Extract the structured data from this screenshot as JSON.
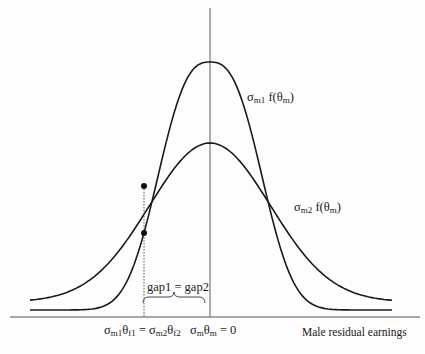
{
  "figure": {
    "curve_narrow_label": {
      "sigma": "σ",
      "sub": "m1",
      "func": " f(θ",
      "func_sub": "m",
      "close": ")"
    },
    "curve_wide_label": {
      "sigma": "σ",
      "sub": "m2",
      "func": " f(θ",
      "func_sub": "m",
      "close": ")"
    },
    "brace_label": "gap1 = gap2",
    "x_axis_label": "Male residual earnings",
    "x_tick_left": {
      "parts": [
        [
          "σ",
          "m1"
        ],
        [
          "θ",
          "f1"
        ],
        [
          " = σ",
          "m2"
        ],
        [
          "θ",
          "f2"
        ]
      ]
    },
    "x_tick_center": {
      "parts": [
        [
          "σ",
          "m"
        ],
        [
          "θ",
          "m"
        ],
        [
          " = 0",
          ""
        ]
      ]
    },
    "colors": {
      "curve": "#1a1a1a",
      "axis": "#555555",
      "dot": "#111111"
    }
  },
  "chart_data": {
    "type": "line",
    "title": "",
    "xlabel": "Male residual earnings",
    "ylabel": "",
    "axis_x_px": 210,
    "axis_y_px": 317,
    "series": [
      {
        "name": "σm1 f(θm)",
        "peak_px": [
          210,
          62
        ],
        "baseline_px": 310,
        "height_px": 248,
        "scale_px": 62.3,
        "power": 2.67
      },
      {
        "name": "σm2 f(θm)",
        "peak_px": [
          210,
          143
        ],
        "baseline_px": 302,
        "height_px": 159,
        "scale_px": 85.5,
        "power": 2.0
      }
    ],
    "x_range_px": [
      30,
      392
    ],
    "marked_points_px": [
      [
        144,
        186
      ],
      [
        144,
        233
      ]
    ],
    "annotations": [
      "gap1 = gap2",
      "σm1θf1 = σm2θf2",
      "σmθm = 0"
    ]
  }
}
